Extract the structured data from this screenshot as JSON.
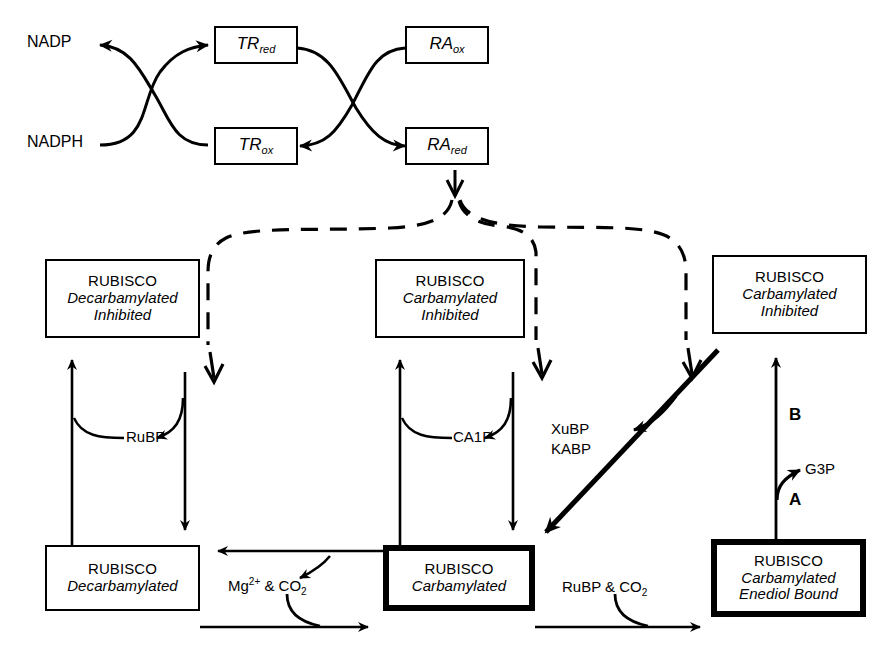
{
  "diagram": {
    "background_color": "#ffffff",
    "line_color": "#000000"
  },
  "redox": {
    "nadp_label": "NADP",
    "nadph_label": "NADPH",
    "boxes": [
      {
        "id": "tr-red",
        "base": "TR",
        "sub": "red"
      },
      {
        "id": "tr-ox",
        "base": "TR",
        "sub": "ox"
      },
      {
        "id": "ra-ox",
        "base": "RA",
        "sub": "ox"
      },
      {
        "id": "ra-red",
        "base": "RA",
        "sub": "red"
      }
    ]
  },
  "inhibited_row": {
    "left": {
      "title": "RUBISCO",
      "line2": "Decarbamylated",
      "line3": "Inhibited"
    },
    "middle": {
      "title": "RUBISCO",
      "line2": "Carbamylated",
      "line3": "Inhibited"
    },
    "right": {
      "title": "RUBISCO",
      "line2": "Carbamylated",
      "line3": "Inhibited"
    }
  },
  "active_row": {
    "left": {
      "title": "RUBISCO",
      "line2": "Decarbamylated",
      "line3": ""
    },
    "middle": {
      "title": "RUBISCO",
      "line2": "Carbamylated",
      "line3": ""
    },
    "right": {
      "title": "RUBISCO",
      "line2": "Carbamylated",
      "line3": "Enediol Bound"
    }
  },
  "metabolites": {
    "rubp": "RuBP",
    "ca1p": "CA1P",
    "xubp": "XuBP",
    "kabp": "KABP",
    "g3p": "G3P",
    "mg_co2_prefix": "Mg",
    "mg_co2_charge": "2+",
    "mg_co2_mid": " & CO",
    "mg_co2_sub": "2",
    "rubp_co2_prefix": "RuBP & CO",
    "rubp_co2_sub": "2"
  },
  "steps": {
    "a": "A",
    "b": "B"
  }
}
